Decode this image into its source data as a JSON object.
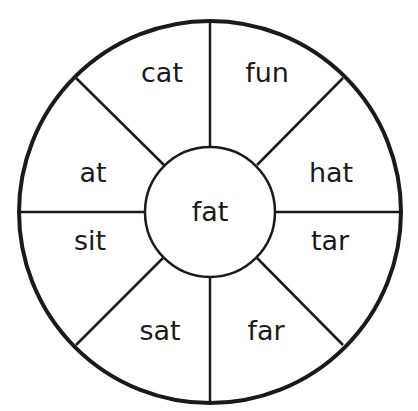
{
  "wheel": {
    "center_word": "fat",
    "segments": [
      {
        "label": "cat",
        "x": 162,
        "y": 82
      },
      {
        "label": "fun",
        "x": 267,
        "y": 82
      },
      {
        "label": "hat",
        "x": 331,
        "y": 182
      },
      {
        "label": "tar",
        "x": 330,
        "y": 250
      },
      {
        "label": "far",
        "x": 266,
        "y": 340
      },
      {
        "label": "sat",
        "x": 160,
        "y": 340
      },
      {
        "label": "sit",
        "x": 90,
        "y": 250
      },
      {
        "label": "at",
        "x": 93,
        "y": 182
      }
    ],
    "colors": {
      "stroke": "#1a1a1a",
      "background": "#ffffff"
    }
  }
}
